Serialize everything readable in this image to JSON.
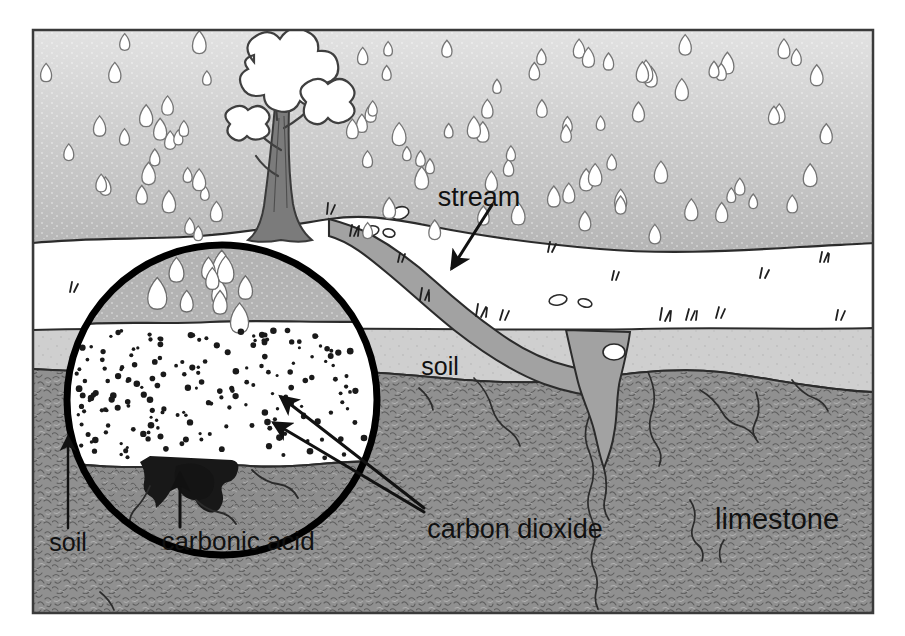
{
  "figure": {
    "frame": {
      "x": 33,
      "y": 30,
      "width": 840,
      "height": 583,
      "border_color": "#333333"
    }
  },
  "labels": {
    "stream": "stream",
    "soil_main": "soil",
    "limestone": "limestone",
    "carbon_dioxide": "carbon dioxide",
    "carbonic_acid": "carbonic acid",
    "soil_inset": "soil"
  },
  "layers": [
    {
      "name": "sky",
      "label": "",
      "color": "#b7b7b7"
    },
    {
      "name": "surface",
      "label": "",
      "color": "#ffffff"
    },
    {
      "name": "soil",
      "label": "soil",
      "color": "#cfcfcf"
    },
    {
      "name": "limestone",
      "label": "limestone",
      "color": "#8e8e8e"
    },
    {
      "name": "stream-water",
      "label": "stream",
      "color": "#a0a0a0"
    }
  ],
  "inset": {
    "name": "magnifier-circle",
    "center_x": 222,
    "center_y": 400,
    "radius": 158,
    "ring_color": "#000000",
    "zones": [
      {
        "name": "inset-sky",
        "color": "#b0b0b0"
      },
      {
        "name": "inset-soil",
        "color": "#ffffff"
      },
      {
        "name": "inset-limestone",
        "color": "#8e8e8e"
      },
      {
        "name": "inset-carbonic-acid",
        "color": "#1a1a1a"
      }
    ],
    "co2_particle_count": 190
  },
  "colors": {
    "sky_top": "#dcdcdc",
    "sky_bottom": "#a8a8a8",
    "soil": "#cfcfcf",
    "limestone": "#8e8e8e",
    "water": "#a0a0a0",
    "ink": "#111111",
    "trunk": "#6d6d6d"
  },
  "rain": {
    "drop_count": 96,
    "drop_fill": "#ffffff",
    "drop_stroke": "#7a7a7a"
  },
  "tree": {
    "name": "tree",
    "trunk_color": "#6f6f6f",
    "foliage_fill": "#ffffff",
    "foliage_stroke": "#4a4a4a"
  },
  "arrows": [
    {
      "name": "stream-arrow",
      "from_label": "stream",
      "x1": 492,
      "y1": 205,
      "x2": 452,
      "y2": 268
    },
    {
      "name": "carbon-dioxide-arrow-upper",
      "from_label": "carbon dioxide",
      "x1": 420,
      "y1": 510,
      "x2": 279,
      "y2": 398
    },
    {
      "name": "carbon-dioxide-arrow-lower",
      "from_label": "carbon dioxide",
      "x1": 420,
      "y1": 512,
      "x2": 272,
      "y2": 424
    },
    {
      "name": "carbonic-acid-arrow",
      "from_label": "carbonic acid",
      "x1": 180,
      "y1": 530,
      "x2": 180,
      "y2": 474
    },
    {
      "name": "soil-inset-arrow",
      "from_label": "soil",
      "x1": 68,
      "y1": 530,
      "x2": 68,
      "y2": 437
    }
  ]
}
